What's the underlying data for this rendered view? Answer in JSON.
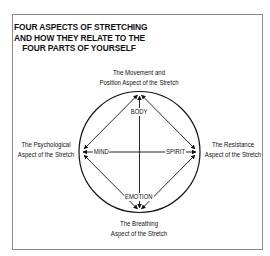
{
  "title": {
    "lines": [
      "FOUR ASPECTS OF STRETCHING",
      "AND HOW THEY RELATE TO THE",
      "FOUR PARTS OF YOURSELF"
    ]
  },
  "aspects": {
    "top": {
      "lines": [
        "The Movement and",
        "Position Aspect of the Stretch"
      ]
    },
    "left": {
      "lines": [
        "The Psychological",
        "Aspect of the Stretch"
      ]
    },
    "right": {
      "lines": [
        "The Resistance",
        "Aspect of the Stretch"
      ]
    },
    "bottom": {
      "lines": [
        "The Breathing",
        "Aspect of the Stretch"
      ]
    }
  },
  "parts": {
    "top": "BODY",
    "left": "MIND",
    "right": "SPIRIT",
    "bottom": "EMOTION"
  },
  "colors": {
    "line": "#111111",
    "frame": "#8a8a8a",
    "background": "#ffffff"
  }
}
